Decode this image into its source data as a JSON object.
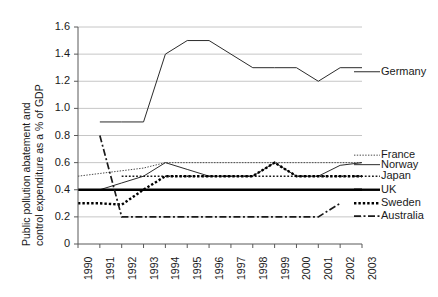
{
  "chart_data": {
    "type": "line",
    "title": "",
    "xlabel": "",
    "ylabel": "Public pollution abatement and control expenditure as a % of GDP",
    "ylabel_line1": "Public pollution abatement and",
    "ylabel_line2": "control expenditure as a % of GDP",
    "grid": true,
    "legend_position": "right",
    "xlim": [
      1990,
      2003
    ],
    "ylim": [
      0,
      1.6
    ],
    "categories": [
      1990,
      1991,
      1992,
      1993,
      1994,
      1995,
      1996,
      1997,
      1998,
      1999,
      2000,
      2001,
      2002,
      2003
    ],
    "xtick_labels": [
      "1990",
      "1991",
      "1992",
      "1993",
      "1994",
      "1995",
      "1996",
      "1997",
      "1998",
      "1999",
      "2000",
      "2001",
      "2002",
      "2003"
    ],
    "ytick_labels": [
      "0",
      "0.2",
      "0.4",
      "0.6",
      "0.8",
      "1.0",
      "1.2",
      "1.4",
      "1.6"
    ],
    "ytick_values": [
      0,
      0.2,
      0.4,
      0.6,
      0.8,
      1.0,
      1.2,
      1.4,
      1.6
    ],
    "series": [
      {
        "name": "Germany",
        "style": "solid-thin",
        "color": "#2b2b2b",
        "x": [
          1991,
          1992,
          1993,
          1994,
          1995,
          1996,
          1997,
          1998,
          1999,
          2000,
          2001,
          2002,
          2003
        ],
        "values": [
          0.9,
          0.9,
          0.9,
          1.4,
          1.5,
          1.5,
          1.4,
          1.3,
          1.3,
          1.3,
          1.2,
          1.3,
          1.3
        ]
      },
      {
        "name": "France",
        "style": "dotted-fine",
        "color": "#4a4a4a",
        "x": [
          1990,
          1991,
          1992,
          1993,
          1994,
          1995,
          1996,
          1997,
          1998,
          1999,
          2000,
          2001,
          2002,
          2003
        ],
        "values": [
          0.5,
          0.52,
          0.54,
          0.56,
          0.6,
          0.6,
          0.6,
          0.6,
          0.6,
          0.6,
          0.6,
          0.6,
          0.6,
          0.6
        ]
      },
      {
        "name": "Norway",
        "style": "solid-thin",
        "color": "#2b2b2b",
        "x": [
          1991,
          1992,
          1993,
          1994,
          1995,
          1996,
          1997,
          1998,
          1999,
          2000,
          2001,
          2002,
          2003
        ],
        "values": [
          0.4,
          0.45,
          0.5,
          0.6,
          0.55,
          0.5,
          0.5,
          0.5,
          0.6,
          0.5,
          0.5,
          0.58,
          0.6
        ]
      },
      {
        "name": "Japan",
        "style": "dotted-medium",
        "color": "#1a1a1a",
        "x": [
          1992,
          1993,
          1994,
          1995,
          1996,
          1997,
          1998,
          1999,
          2000,
          2001,
          2002,
          2003
        ],
        "values": [
          0.5,
          0.5,
          0.5,
          0.5,
          0.5,
          0.5,
          0.5,
          0.5,
          0.5,
          0.5,
          0.5,
          0.5
        ]
      },
      {
        "name": "UK",
        "style": "solid-thick",
        "color": "#000000",
        "x": [
          1990,
          2003
        ],
        "values": [
          0.4,
          0.4
        ]
      },
      {
        "name": "Sweden",
        "style": "dotted-thick",
        "color": "#000000",
        "x": [
          1990,
          1991,
          1992,
          1993,
          1994,
          1995,
          1996,
          1997,
          1998,
          1999,
          2000,
          2001,
          2002,
          2003
        ],
        "values": [
          0.3,
          0.3,
          0.29,
          0.4,
          0.5,
          0.5,
          0.5,
          0.5,
          0.5,
          0.6,
          0.5,
          0.5,
          0.5,
          0.5
        ]
      },
      {
        "name": "Australia",
        "style": "dash-dot",
        "color": "#1a1a1a",
        "x": [
          1991,
          1992,
          1993,
          1994,
          1995,
          1996,
          1997,
          1998,
          1999,
          2000,
          2001,
          2002
        ],
        "values": [
          0.8,
          0.2,
          0.2,
          0.2,
          0.2,
          0.2,
          0.2,
          0.2,
          0.2,
          0.2,
          0.2,
          0.3
        ]
      }
    ],
    "legend_entries": [
      {
        "label": "Germany",
        "y_anchor": 1.27
      },
      {
        "label": "France",
        "y_anchor": 0.655
      },
      {
        "label": "Norway",
        "y_anchor": 0.585
      },
      {
        "label": "Japan",
        "y_anchor": 0.5
      },
      {
        "label": "UK",
        "y_anchor": 0.4
      },
      {
        "label": "Sweden",
        "y_anchor": 0.3
      },
      {
        "label": "Australia",
        "y_anchor": 0.205
      }
    ],
    "colors": {
      "gridline": "#bfbfbf",
      "axis": "#595959",
      "text": "#1a1a1a",
      "background": "#ffffff"
    }
  }
}
